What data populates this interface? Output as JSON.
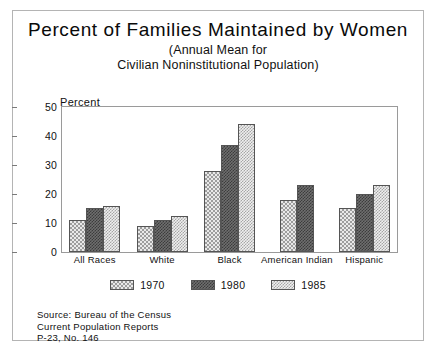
{
  "figure": {
    "title": "Percent of Families Maintained by Women",
    "subtitle_line1": "(Annual Mean for",
    "subtitle_line2": "Civilian Noninstitutional Population)",
    "axis_label": "Percent"
  },
  "source": {
    "line1": "Source:  Bureau of the Census",
    "line2": "Current Population Reports",
    "line3": "P-23, No. 146"
  },
  "legend": {
    "items": [
      {
        "label": "1970",
        "pattern": "p1970"
      },
      {
        "label": "1980",
        "pattern": "p1980"
      },
      {
        "label": "1985",
        "pattern": "p1985"
      }
    ]
  },
  "chart_data": {
    "type": "bar",
    "title": "Percent of Families Maintained by Women",
    "subtitle": "(Annual Mean for Civilian Noninstitutional Population)",
    "xlabel": "",
    "ylabel": "Percent",
    "ylim": [
      0,
      50
    ],
    "yticks": [
      0,
      10,
      20,
      30,
      40,
      50
    ],
    "grid": false,
    "legend_position": "bottom",
    "categories": [
      "All Races",
      "White",
      "Black",
      "American Indian",
      "Hispanic"
    ],
    "series": [
      {
        "name": "1970",
        "values": [
          11,
          9,
          28,
          18,
          15
        ]
      },
      {
        "name": "1980",
        "values": [
          15,
          11,
          37,
          23,
          20
        ]
      },
      {
        "name": "1985",
        "values": [
          16,
          12.5,
          44,
          null,
          23
        ]
      }
    ]
  }
}
